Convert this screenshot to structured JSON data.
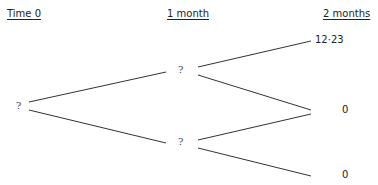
{
  "headers": {
    "t0": "Time 0",
    "t1": "1 month",
    "t2": "2 months"
  },
  "nodes": {
    "root": "?",
    "up": "?",
    "down": "?"
  },
  "leaves": {
    "uu": "12·23",
    "ud": "0",
    "dd": "0"
  },
  "line_color": "#333333"
}
